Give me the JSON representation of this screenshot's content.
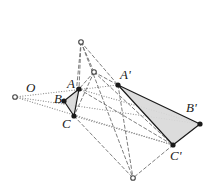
{
  "figure": {
    "type": "geometric-diagram",
    "width": 211,
    "height": 193,
    "colors": {
      "stroke": "#1a1a1a",
      "dashed_stroke": "#6e6e6e",
      "dotted_stroke": "#8a8a8a",
      "triangle_fill": "#d9d9d9",
      "vertex_fill": "#1a1a1a",
      "hollow_fill": "#ffffff",
      "background": "#ffffff"
    },
    "points": {
      "O": {
        "x": 15,
        "y": 97,
        "label": "O",
        "lx": 26,
        "ly": 81,
        "kind": "hollow"
      },
      "A": {
        "x": 79,
        "y": 89,
        "label": "A",
        "lx": 67,
        "ly": 77,
        "kind": "solid"
      },
      "B": {
        "x": 64,
        "y": 101,
        "label": "B",
        "lx": 54,
        "ly": 92,
        "kind": "solid"
      },
      "C": {
        "x": 74,
        "y": 116,
        "label": "C",
        "lx": 62,
        "ly": 117,
        "kind": "solid"
      },
      "Ap": {
        "x": 118,
        "y": 85,
        "label": "A'",
        "lx": 120,
        "ly": 68,
        "kind": "solid"
      },
      "Bp": {
        "x": 200,
        "y": 124,
        "label": "B'",
        "lx": 186,
        "ly": 101,
        "kind": "solid"
      },
      "Cp": {
        "x": 173,
        "y": 145,
        "label": "C'",
        "lx": 170,
        "ly": 149,
        "kind": "solid"
      },
      "P1": {
        "x": 81,
        "y": 42,
        "label": "",
        "lx": 0,
        "ly": 0,
        "kind": "hollow"
      },
      "P2": {
        "x": 94,
        "y": 72,
        "label": "",
        "lx": 0,
        "ly": 0,
        "kind": "hollow"
      },
      "P3": {
        "x": 133,
        "y": 178,
        "label": "",
        "lx": 0,
        "ly": 0,
        "kind": "hollow"
      }
    },
    "triangles": [
      {
        "name": "triangle-ABC",
        "vertices": [
          "A",
          "B",
          "C"
        ],
        "filled": true
      },
      {
        "name": "triangle-ApBpCp",
        "vertices": [
          "Ap",
          "Bp",
          "Cp"
        ],
        "filled": true
      }
    ],
    "dotted_rays": [
      {
        "name": "ray-O-A-Ap",
        "from": "O",
        "to": "Ap"
      },
      {
        "name": "ray-O-B-Bp",
        "from": "O",
        "to": "Bp"
      },
      {
        "name": "ray-O-C-Cp",
        "from": "O",
        "to": "Cp"
      }
    ],
    "dotted_segments": [
      {
        "name": "segment-A-Bp",
        "from": "A",
        "to": "Bp"
      },
      {
        "name": "segment-C-Cp",
        "from": "C",
        "to": "Cp"
      }
    ],
    "dashed_segments": [
      {
        "name": "dash-P1-A",
        "from": "P1",
        "to": "A"
      },
      {
        "name": "dash-P1-C",
        "from": "P1",
        "to": "C"
      },
      {
        "name": "dash-P1-P2",
        "from": "P1",
        "to": "P2"
      },
      {
        "name": "dash-P1-Ap",
        "from": "P1",
        "to": "Ap"
      },
      {
        "name": "dash-P1-P3",
        "from": "P1",
        "to": "P3"
      },
      {
        "name": "dash-P2-A",
        "from": "P2",
        "to": "A"
      },
      {
        "name": "dash-P2-C",
        "from": "P2",
        "to": "C"
      },
      {
        "name": "dash-P2-Ap",
        "from": "P2",
        "to": "Ap"
      },
      {
        "name": "dash-P2-Cp",
        "from": "P2",
        "to": "Cp"
      },
      {
        "name": "dash-C-P3",
        "from": "C",
        "to": "P3"
      },
      {
        "name": "dash-Cp-P3",
        "from": "Cp",
        "to": "P3"
      },
      {
        "name": "dash-Ap-P3",
        "from": "Ap",
        "to": "P3"
      },
      {
        "name": "dash-A-Cp",
        "from": "A",
        "to": "Cp"
      }
    ]
  }
}
